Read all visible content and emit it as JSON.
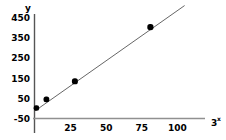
{
  "chart_data": {
    "type": "scatter",
    "title": "",
    "subtitle": "",
    "xlabel": "3x",
    "xlabel_base": "3",
    "xlabel_exponent": "x",
    "ylabel": "y",
    "x": [
      1,
      8,
      28,
      81
    ],
    "y": [
      2,
      45,
      135,
      405
    ],
    "points": [
      {
        "x": 1,
        "y": 2
      },
      {
        "x": 8,
        "y": 45
      },
      {
        "x": 28,
        "y": 135
      },
      {
        "x": 81,
        "y": 405
      }
    ],
    "xticks": [
      25,
      50,
      75,
      100
    ],
    "xtick_labels": [
      "25",
      "50",
      "75",
      "100"
    ],
    "yticks": [
      -50,
      50,
      150,
      250,
      350,
      450
    ],
    "ytick_labels": [
      "-50",
      "50",
      "150",
      "250",
      "350",
      "450"
    ],
    "xlim": [
      0,
      113
    ],
    "ylim": [
      -50,
      470
    ],
    "grid": false,
    "legend": "none",
    "trendline": {
      "type": "line",
      "x_start": 0,
      "y_start": -12,
      "x_end": 105,
      "y_end": 512
    },
    "marker_color": "#000000",
    "line_color": "#555555",
    "axis_color": "#808080",
    "background_color": "#ffffff"
  }
}
